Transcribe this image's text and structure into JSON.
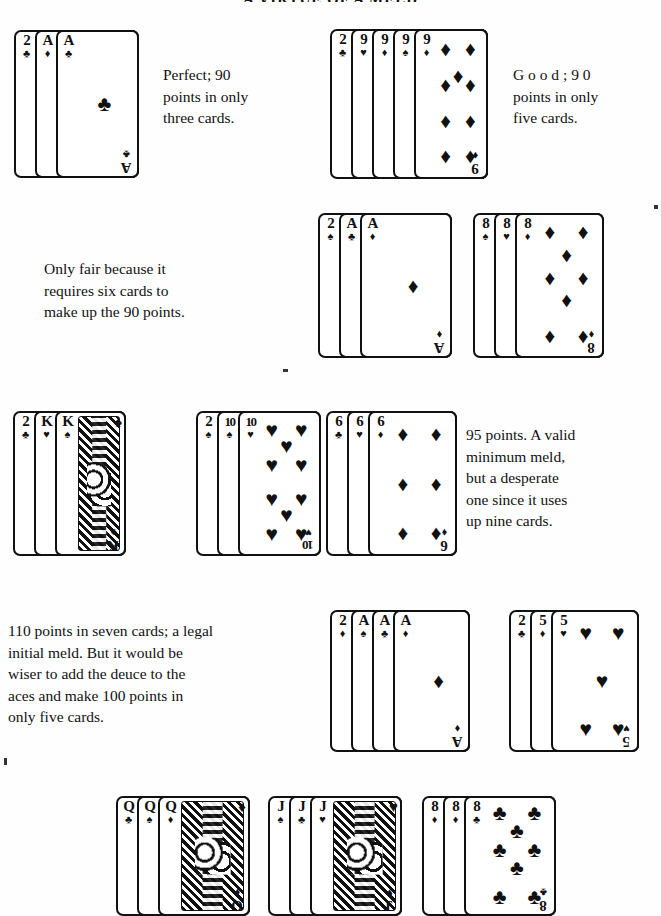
{
  "page": {
    "running_head": "A VIRTUE OF A MELD",
    "width": 661,
    "height": 902,
    "ink_color": "#111111",
    "paper_color": "#fefefe"
  },
  "examples": [
    {
      "id": "example-1",
      "caption_lines": [
        "Perfect;  90",
        "points in only",
        "three cards."
      ],
      "caption_text": "Perfect; 90 points in only three cards.",
      "points": 90,
      "card_count": 3,
      "cards": [
        {
          "rank": "2",
          "suit": "♣",
          "suit_name": "clubs"
        },
        {
          "rank": "A",
          "suit": "♦",
          "suit_name": "diamonds"
        },
        {
          "rank": "A",
          "suit": "♣",
          "suit_name": "clubs",
          "face_up": true,
          "pip_count": 1
        }
      ]
    },
    {
      "id": "example-2",
      "caption_lines": [
        "G o o d ;  9 0",
        "points in only",
        "five cards."
      ],
      "caption_text": "Good; 90 points in only five cards.",
      "points": 90,
      "card_count": 5,
      "cards": [
        {
          "rank": "2",
          "suit": "♣",
          "suit_name": "clubs"
        },
        {
          "rank": "9",
          "suit": "♥",
          "suit_name": "hearts"
        },
        {
          "rank": "9",
          "suit": "♦",
          "suit_name": "diamonds"
        },
        {
          "rank": "9",
          "suit": "♠",
          "suit_name": "spades"
        },
        {
          "rank": "9",
          "suit": "♦",
          "suit_name": "diamonds",
          "face_up": true,
          "pip_count": 9
        }
      ]
    },
    {
      "id": "example-3",
      "caption_lines": [
        "Only  fair  because  it",
        "requires  six  cards  to",
        "make up the 90 points."
      ],
      "caption_text": "Only fair because it requires six cards to make up the 90 points.",
      "points": 90,
      "card_count": 6,
      "groups": [
        {
          "cards": [
            {
              "rank": "2",
              "suit": "♠",
              "suit_name": "spades"
            },
            {
              "rank": "A",
              "suit": "♣",
              "suit_name": "clubs"
            },
            {
              "rank": "A",
              "suit": "♦",
              "suit_name": "diamonds",
              "face_up": true,
              "pip_count": 1
            }
          ]
        },
        {
          "cards": [
            {
              "rank": "8",
              "suit": "♠",
              "suit_name": "spades"
            },
            {
              "rank": "8",
              "suit": "♥",
              "suit_name": "hearts"
            },
            {
              "rank": "8",
              "suit": "♦",
              "suit_name": "diamonds",
              "face_up": true,
              "pip_count": 8
            }
          ]
        }
      ]
    },
    {
      "id": "example-4",
      "caption_lines": [
        "95 points. A valid",
        "minimum  meld,",
        "but  a  desperate",
        "one  since  it  uses",
        "up nine cards."
      ],
      "caption_text": "95 points. A valid minimum meld, but a desperate one since it uses up nine cards.",
      "points": 95,
      "card_count": 9,
      "groups": [
        {
          "cards": [
            {
              "rank": "2",
              "suit": "♣",
              "suit_name": "clubs"
            },
            {
              "rank": "K",
              "suit": "♥",
              "suit_name": "hearts"
            },
            {
              "rank": "K",
              "suit": "♠",
              "suit_name": "spades",
              "face_up": true,
              "court": true
            }
          ]
        },
        {
          "cards": [
            {
              "rank": "2",
              "suit": "♠",
              "suit_name": "spades"
            },
            {
              "rank": "10",
              "suit": "♠",
              "suit_name": "spades"
            },
            {
              "rank": "10",
              "suit": "♥",
              "suit_name": "hearts",
              "face_up": true,
              "pip_count": 10
            }
          ]
        },
        {
          "cards": [
            {
              "rank": "6",
              "suit": "♣",
              "suit_name": "clubs"
            },
            {
              "rank": "6",
              "suit": "♥",
              "suit_name": "hearts"
            },
            {
              "rank": "6",
              "suit": "♦",
              "suit_name": "diamonds",
              "face_up": true,
              "pip_count": 6
            }
          ]
        }
      ]
    },
    {
      "id": "example-5",
      "caption_lines": [
        "110 points in seven cards; a legal",
        "initial meld. But it would be",
        "wiser to add the deuce to the",
        "aces and make 100 points in",
        "only five cards."
      ],
      "caption_text": "110 points in seven cards; a legal initial meld. But it would be wiser to add the deuce to the aces and make 100 points in only five cards.",
      "points": 110,
      "card_count": 7,
      "alt_points": 100,
      "alt_card_count": 5,
      "groups": [
        {
          "cards": [
            {
              "rank": "2",
              "suit": "♦",
              "suit_name": "diamonds"
            },
            {
              "rank": "A",
              "suit": "♠",
              "suit_name": "spades"
            },
            {
              "rank": "A",
              "suit": "♣",
              "suit_name": "clubs"
            },
            {
              "rank": "A",
              "suit": "♦",
              "suit_name": "diamonds",
              "face_up": true,
              "pip_count": 1
            }
          ]
        },
        {
          "cards": [
            {
              "rank": "2",
              "suit": "♣",
              "suit_name": "clubs"
            },
            {
              "rank": "5",
              "suit": "♦",
              "suit_name": "diamonds"
            },
            {
              "rank": "5",
              "suit": "♥",
              "suit_name": "hearts",
              "face_up": true,
              "pip_count": 5
            }
          ]
        }
      ]
    },
    {
      "id": "example-6",
      "caption_lines": [],
      "caption_text": "",
      "groups": [
        {
          "cards": [
            {
              "rank": "Q",
              "suit": "♣",
              "suit_name": "clubs"
            },
            {
              "rank": "Q",
              "suit": "♠",
              "suit_name": "spades"
            },
            {
              "rank": "Q",
              "suit": "♦",
              "suit_name": "diamonds",
              "face_up": true,
              "court": true
            }
          ]
        },
        {
          "cards": [
            {
              "rank": "J",
              "suit": "♠",
              "suit_name": "spades"
            },
            {
              "rank": "J",
              "suit": "♣",
              "suit_name": "clubs"
            },
            {
              "rank": "J",
              "suit": "♥",
              "suit_name": "hearts",
              "face_up": true,
              "court": true
            }
          ]
        },
        {
          "cards": [
            {
              "rank": "8",
              "suit": "♦",
              "suit_name": "diamonds"
            },
            {
              "rank": "8",
              "suit": "♦",
              "suit_name": "diamonds"
            },
            {
              "rank": "8",
              "suit": "♣",
              "suit_name": "clubs",
              "face_up": true,
              "pip_count": 8
            }
          ]
        }
      ]
    }
  ]
}
